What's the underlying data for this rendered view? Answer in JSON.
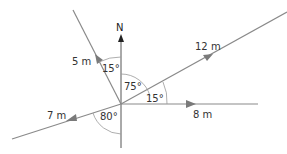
{
  "diagram": {
    "north_label": "N",
    "vectors": [
      {
        "id": "v5",
        "label": "5 m",
        "bearing_deg": 345
      },
      {
        "id": "v12",
        "label": "12 m",
        "bearing_deg": 75
      },
      {
        "id": "v8",
        "label": "8 m",
        "bearing_deg": 90
      },
      {
        "id": "v7",
        "label": "7 m",
        "bearing_deg": 260
      }
    ],
    "angles": [
      {
        "id": "a15n",
        "label": "15°",
        "between": "N and 5 m"
      },
      {
        "id": "a75",
        "label": "75°",
        "between": "N and 12 m"
      },
      {
        "id": "a15e",
        "label": "15°",
        "between": "12 m and 8 m"
      },
      {
        "id": "a80",
        "label": "80°",
        "between": "7 m and S"
      }
    ],
    "colors": {
      "line": "#8a8a8a",
      "arrow": "#7a7a7a",
      "text": "#333333",
      "north": "#222222"
    }
  }
}
